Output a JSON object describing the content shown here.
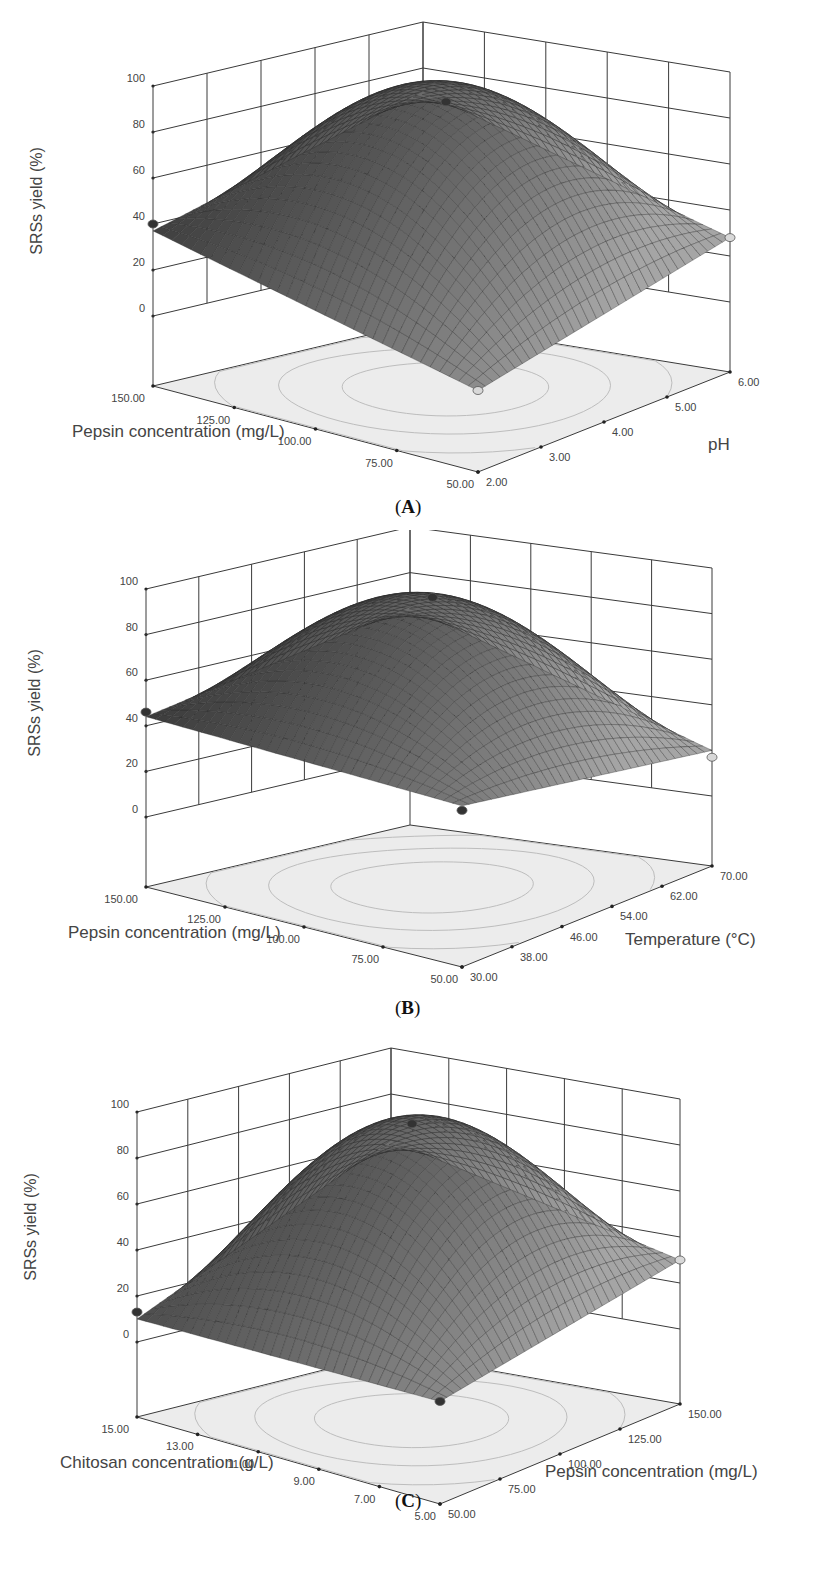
{
  "figure": {
    "panels": [
      {
        "id": "A",
        "label_open": "(",
        "label_letter": "A",
        "label_close": ")"
      },
      {
        "id": "B",
        "label_open": "(",
        "label_letter": "B",
        "label_close": ")"
      },
      {
        "id": "C",
        "label_open": "(",
        "label_letter": "C",
        "label_close": ")"
      }
    ]
  },
  "colors": {
    "grid": "#3a3a3a",
    "floor": "#ececec",
    "contour": "#bdbdbd",
    "surface_dark": "#1e1e1e",
    "surface_light": "#9a9a9a",
    "point_dark": "#333333",
    "point_light": "#d8d8d8",
    "text": "#444444"
  },
  "chart_data": [
    {
      "type": "surface3d",
      "panel": "A",
      "zlabel": "SRSs yield (%)",
      "xlabel": "Pepsin concentration (mg/L)",
      "ylabel": "pH",
      "x_ticks": [
        "150.00",
        "125.00",
        "100.00",
        "75.00",
        "50.00"
      ],
      "y_ticks": [
        "2.00",
        "3.00",
        "4.00",
        "5.00",
        "6.00"
      ],
      "z_ticks": [
        "0",
        "20",
        "40",
        "60",
        "80",
        "100"
      ],
      "xlim": [
        50,
        150
      ],
      "ylim": [
        2,
        6
      ],
      "zlim": [
        0,
        100
      ],
      "surface": {
        "peak": 94,
        "corner_left": 37,
        "corner_front": 5,
        "corner_right": 28,
        "corner_back": 70
      },
      "design_points": [
        {
          "x": 150,
          "y": 2,
          "z": 40,
          "style": "dark"
        },
        {
          "x": 100,
          "y": 4,
          "z": 94,
          "style": "dark"
        },
        {
          "x": 50,
          "y": 2,
          "z": 5,
          "style": "light"
        },
        {
          "x": 50,
          "y": 6,
          "z": 28,
          "style": "light"
        }
      ]
    },
    {
      "type": "surface3d",
      "panel": "B",
      "zlabel": "SRSs yield (%)",
      "xlabel": "Pepsin concentration (mg/L)",
      "ylabel": "Temperature (°C)",
      "x_ticks": [
        "150.00",
        "125.00",
        "100.00",
        "75.00",
        "50.00"
      ],
      "y_ticks": [
        "30.00",
        "38.00",
        "46.00",
        "54.00",
        "62.00",
        "70.00"
      ],
      "z_ticks": [
        "0",
        "20",
        "40",
        "60",
        "80",
        "100"
      ],
      "xlim": [
        50,
        150
      ],
      "ylim": [
        30,
        70
      ],
      "zlim": [
        0,
        100
      ],
      "surface": {
        "peak": 93,
        "corner_left": 44,
        "corner_front": 40,
        "corner_right": 20,
        "corner_back": 65
      },
      "design_points": [
        {
          "x": 150,
          "y": 30,
          "z": 46,
          "style": "dark"
        },
        {
          "x": 100,
          "y": 50,
          "z": 96,
          "style": "dark"
        },
        {
          "x": 50,
          "y": 30,
          "z": 38,
          "style": "dark"
        },
        {
          "x": 50,
          "y": 70,
          "z": 17,
          "style": "light"
        }
      ]
    },
    {
      "type": "surface3d",
      "panel": "C",
      "zlabel": "SRSs yield (%)",
      "xlabel": "Chitosan concentration (g/L)",
      "ylabel": "Pepsin concentration (mg/L)",
      "x_ticks": [
        "15.00",
        "13.00",
        "11.00",
        "9.00",
        "7.00",
        "5.00"
      ],
      "y_ticks": [
        "50.00",
        "75.00",
        "100.00",
        "125.00",
        "150.00"
      ],
      "z_ticks": [
        "0",
        "20",
        "40",
        "60",
        "80",
        "100"
      ],
      "xlim": [
        5,
        15
      ],
      "ylim": [
        50,
        150
      ],
      "zlim": [
        0,
        100
      ],
      "surface": {
        "peak": 93,
        "corner_left": 10,
        "corner_front": 12,
        "corner_right": 30,
        "corner_back": 60
      },
      "design_points": [
        {
          "x": 15,
          "y": 50,
          "z": 13,
          "style": "dark"
        },
        {
          "x": 10,
          "y": 100,
          "z": 96,
          "style": "dark"
        },
        {
          "x": 5,
          "y": 50,
          "z": 12,
          "style": "dark"
        },
        {
          "x": 5,
          "y": 150,
          "z": 30,
          "style": "light"
        }
      ]
    }
  ]
}
